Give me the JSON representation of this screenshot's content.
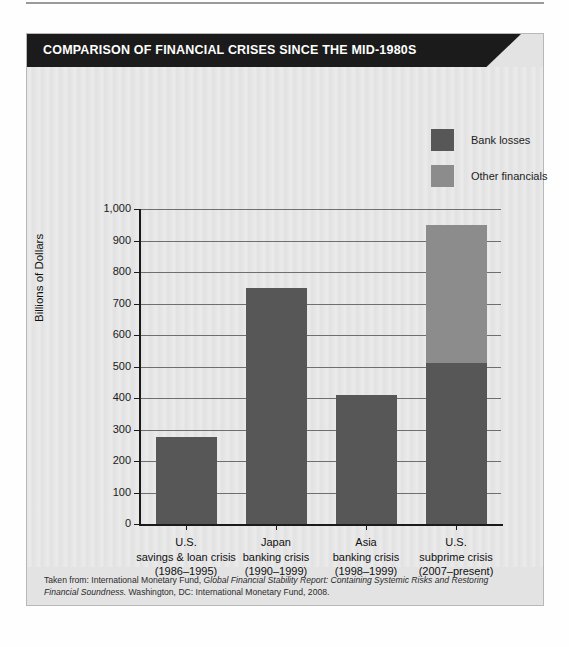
{
  "figure": {
    "banner_title": "COMPARISON OF FINANCIAL CRISES SINCE THE MID-1980S",
    "footnote_line1_prefix": "Taken from: International Monetary Fund, ",
    "footnote_line1_italic": "Global Financial Stability Report: Containing Systemic Risks and Restoring Financial Soundness.",
    "footnote_line2": "Washington, DC: International Monetary Fund, 2008."
  },
  "colors": {
    "banner_bg": "#1b1b1b",
    "panel_bg": "#e3e3e3",
    "plot_bg": "#e6e6e6",
    "bank_losses": "#575757",
    "other_financials": "#8c8c8c",
    "axis": "#1a1a1a",
    "gridline": "#6e6e6e"
  },
  "legend": {
    "position": "top-right",
    "items": [
      {
        "label": "Bank losses",
        "color": "#575757"
      },
      {
        "label": "Other financials",
        "color": "#8c8c8c"
      }
    ]
  },
  "chart_data": {
    "type": "bar",
    "stacked": true,
    "title": "COMPARISON OF FINANCIAL CRISES SINCE THE MID-1980S",
    "xlabel": "",
    "ylabel": "Billions of Dollars",
    "ylim": [
      0,
      1000
    ],
    "ytick_step": 100,
    "ytick_labels": [
      "0",
      "100",
      "200",
      "300",
      "400",
      "500",
      "600",
      "700",
      "800",
      "900",
      "1,000"
    ],
    "grid": true,
    "legend_position": "top-right",
    "categories": [
      "U.S.\nsavings & loan crisis\n(1986–1995)",
      "Japan\nbanking crisis\n(1990–1999)",
      "Asia\nbanking crisis\n(1998–1999)",
      "U.S.\nsubprime crisis\n(2007–present)"
    ],
    "category_lines": [
      [
        "U.S.",
        "savings & loan crisis",
        "(1986–1995)"
      ],
      [
        "Japan",
        "banking crisis",
        "(1990–1999)"
      ],
      [
        "Asia",
        "banking crisis",
        "(1998–1999)"
      ],
      [
        "U.S.",
        "subprime crisis",
        "(2007–present)"
      ]
    ],
    "series": [
      {
        "name": "Bank losses",
        "color": "#575757",
        "values": [
          275,
          750,
          410,
          510
        ]
      },
      {
        "name": "Other financials",
        "color": "#8c8c8c",
        "values": [
          0,
          0,
          0,
          440
        ]
      }
    ],
    "totals": [
      275,
      750,
      410,
      950
    ]
  }
}
